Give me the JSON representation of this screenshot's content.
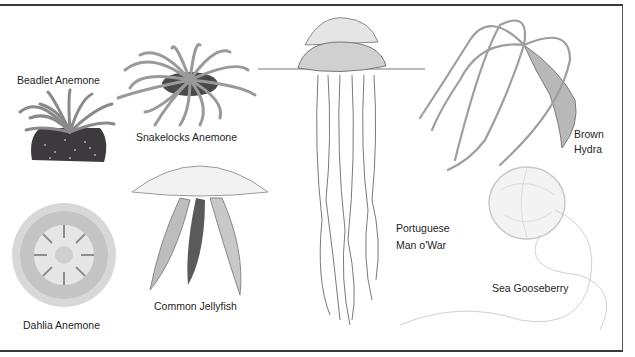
{
  "figure": {
    "labels": {
      "beadlet_anemone": "Beadlet Anemone",
      "snakelocks_anemone": "Snakelocks Anemone",
      "dahlia_anemone": "Dahlia Anemone",
      "common_jellyfish": "Common Jellyfish",
      "portuguese_man_o_war_line1": "Portuguese",
      "portuguese_man_o_war_line2": "Man o'War",
      "brown_hydra_line1": "Brown",
      "brown_hydra_line2": "Hydra",
      "sea_gooseberry": "Sea Gooseberry"
    },
    "colors": {
      "border": "#3a3a3a",
      "text": "#1e1e1e",
      "ink": "#6e6e6e",
      "dark_body": "#3c3a3c"
    }
  }
}
